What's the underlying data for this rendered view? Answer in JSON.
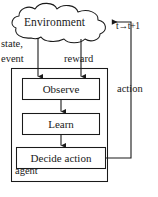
{
  "diagram": {
    "type": "flow-diagram",
    "background_color": "#ffffff",
    "stroke_color": "#1a1a1a",
    "nodes": {
      "environment": {
        "label": "Environment",
        "shape": "cloud"
      },
      "observe": {
        "label": "Observe",
        "shape": "rectangle"
      },
      "learn": {
        "label": "Learn",
        "shape": "rectangle"
      },
      "decide": {
        "label": "Decide action",
        "shape": "rectangle"
      },
      "agent_container": {
        "label": "agent",
        "shape": "rectangle"
      }
    },
    "edge_labels": {
      "state_event_line1": "state,",
      "state_event_line2": "event",
      "reward": "reward",
      "action": "action",
      "timestep": "t→t+1"
    }
  }
}
